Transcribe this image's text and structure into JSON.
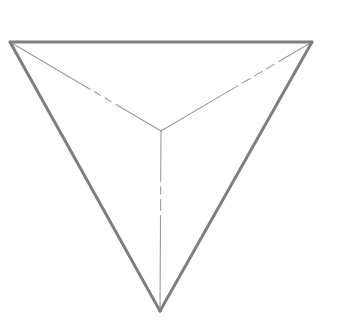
{
  "diagram": {
    "background": "#ffffff",
    "colors": {
      "outer_edge": "#7f7f7f",
      "inner_edge": "#9a9a9a"
    },
    "stroke": {
      "outer_width": 3,
      "inner_width": 1.1
    },
    "vertices": {
      "top_left": [
        10,
        42
      ],
      "top_right": [
        312,
        42
      ],
      "bottom": [
        160,
        311
      ],
      "apex": [
        161,
        131
      ]
    },
    "edges": [
      {
        "id": "top-edge",
        "from": "top_left",
        "to": "top_right",
        "type": "outer"
      },
      {
        "id": "left-edge",
        "from": "top_left",
        "to": "bottom",
        "type": "outer"
      },
      {
        "id": "right-edge",
        "from": "top_right",
        "to": "bottom",
        "type": "outer"
      },
      {
        "id": "inner-left-edge",
        "from": "top_left",
        "to": "apex",
        "type": "inner",
        "gaps": [
          [
            0.53,
            0.56
          ],
          [
            0.6,
            0.63
          ],
          [
            0.67,
            0.7
          ]
        ]
      },
      {
        "id": "inner-right-edge",
        "from": "top_right",
        "to": "apex",
        "type": "inner",
        "gaps": [
          [
            0.22,
            0.25
          ],
          [
            0.3,
            0.33
          ],
          [
            0.38,
            0.41
          ],
          [
            0.46,
            0.49
          ]
        ]
      },
      {
        "id": "inner-vertical-edge",
        "from": "apex",
        "to": "bottom",
        "type": "inner",
        "gaps": [
          [
            0.28,
            0.31
          ],
          [
            0.35,
            0.38
          ],
          [
            0.44,
            0.47
          ]
        ]
      }
    ]
  }
}
